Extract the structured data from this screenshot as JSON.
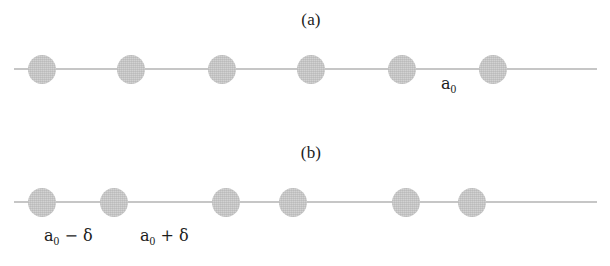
{
  "figure": {
    "background_color": "#ffffff",
    "atom_color": "#d2d2d2",
    "line_color": "#c6c6c6",
    "text_color": "#1c1c1c"
  },
  "panels": [
    {
      "id": "a",
      "caption": "(a)",
      "caption_x": 281,
      "caption_y": 10,
      "line": {
        "x": 14,
        "y": 68,
        "width": 583
      },
      "atom_diameter": 28,
      "atom_centers_x": [
        42,
        131,
        222,
        311,
        402,
        493
      ],
      "atom_center_y": 69,
      "labels": [
        {
          "name": "lattice-constant",
          "text_main": "a",
          "text_sub": "0",
          "x": 441,
          "y": 76
        }
      ]
    },
    {
      "id": "b",
      "caption": "(b)",
      "caption_x": 281,
      "caption_y": 143,
      "line": {
        "x": 14,
        "y": 201,
        "width": 583
      },
      "atom_diameter": 28,
      "atom_centers_x": [
        42,
        114,
        226,
        293,
        406,
        472
      ],
      "atom_center_y": 202,
      "labels": [
        {
          "name": "short-bond",
          "text_main": "a",
          "text_sub": "0",
          "op": " − ",
          "sym": "δ",
          "x": 44,
          "y": 228
        },
        {
          "name": "long-bond",
          "text_main": "a",
          "text_sub": "0",
          "op": " + ",
          "sym": "δ",
          "x": 140,
          "y": 228
        }
      ]
    }
  ]
}
